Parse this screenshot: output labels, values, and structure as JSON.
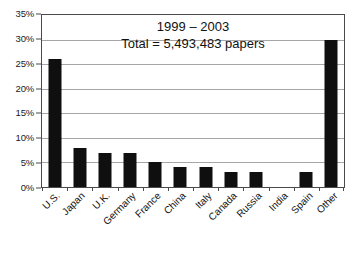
{
  "chart_data": {
    "type": "bar",
    "title": "1999 – 2003",
    "subtitle": "Total = 5,493,483 papers",
    "xlabel": "",
    "ylabel": "",
    "ylim": [
      0,
      35
    ],
    "ytick_step": 5,
    "ytick_labels": [
      "0%",
      "5%",
      "10%",
      "15%",
      "20%",
      "25%",
      "30%",
      "35%"
    ],
    "ytick_values": [
      0,
      5,
      10,
      15,
      20,
      25,
      30,
      35
    ],
    "grid": true,
    "legend": "none",
    "categories": [
      "U.S.",
      "Japan",
      "U.K.",
      "Germany",
      "France",
      "China",
      "Italy",
      "Canada",
      "Russia",
      "India",
      "Spain",
      "Other"
    ],
    "values": [
      26,
      8,
      7,
      7,
      5,
      4,
      4,
      3,
      3,
      0,
      3,
      30
    ],
    "value_unit": "%",
    "bar_color": "#0f0f0f"
  },
  "annotations": {
    "title_text": "1999 – 2003",
    "total_text": "Total = 5,493,483 papers"
  }
}
